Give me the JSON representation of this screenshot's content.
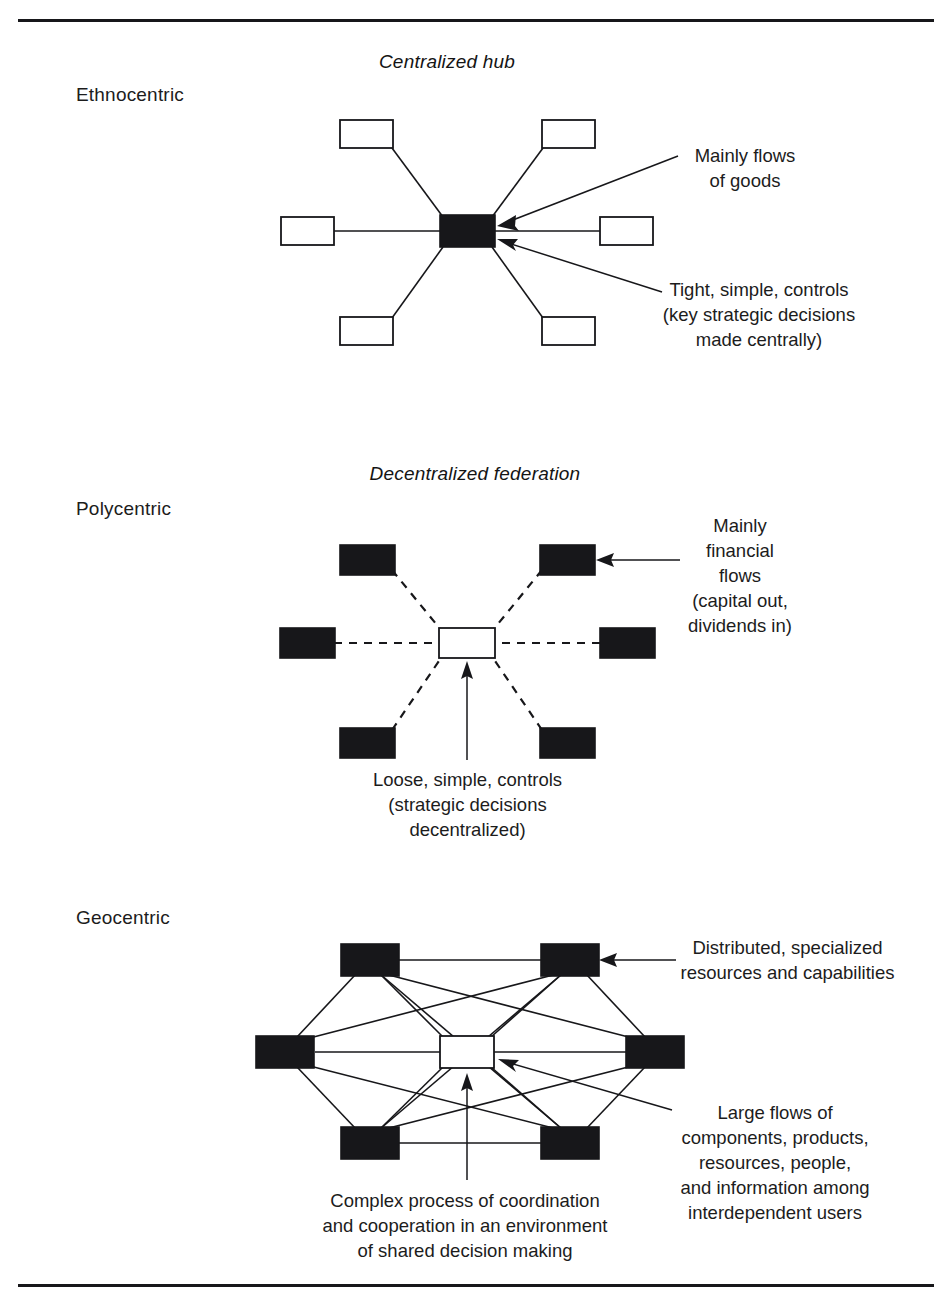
{
  "figure": {
    "rows": [
      {
        "id": "ethnocentric",
        "row_label": "Ethnocentric",
        "model_title": "Centralized hub",
        "center_node": {
          "style": "filled"
        },
        "outer_nodes": {
          "count": 6,
          "style": "open"
        },
        "edge_style": "solid",
        "annotations": [
          {
            "id": "flows-of-goods",
            "text": "Mainly flows\nof goods"
          },
          {
            "id": "tight-controls",
            "text": "Tight, simple, controls\n(key strategic decisions\nmade centrally)"
          }
        ]
      },
      {
        "id": "polycentric",
        "row_label": "Polycentric",
        "model_title": "Decentralized federation",
        "center_node": {
          "style": "open"
        },
        "outer_nodes": {
          "count": 6,
          "style": "filled"
        },
        "edge_style": "dashed",
        "annotations": [
          {
            "id": "financial-flows",
            "text": "Mainly\nfinancial\nflows\n(capital out,\ndividends in)"
          },
          {
            "id": "loose-controls",
            "text": "Loose, simple, controls\n(strategic decisions\ndecentralized)"
          }
        ]
      },
      {
        "id": "geocentric",
        "row_label": "Geocentric",
        "model_title": "",
        "center_node": {
          "style": "open"
        },
        "outer_nodes": {
          "count": 6,
          "style": "filled"
        },
        "edge_style": "mesh",
        "annotations": [
          {
            "id": "distributed-resources",
            "text": "Distributed, specialized\nresources and capabilities"
          },
          {
            "id": "large-flows",
            "text": "Large flows of\ncomponents, products,\nresources, people,\nand information among\ninterdependent users"
          },
          {
            "id": "complex-process",
            "text": "Complex process of coordination\nand cooperation in an environment\nof shared decision making"
          }
        ]
      }
    ],
    "colors": {
      "ink": "#17171a",
      "node_filled": "#17171a",
      "node_open": "#ffffff",
      "background": "#ffffff"
    },
    "icons": {
      "arrow": "arrow-head-icon",
      "rule": "horizontal-rule"
    }
  }
}
